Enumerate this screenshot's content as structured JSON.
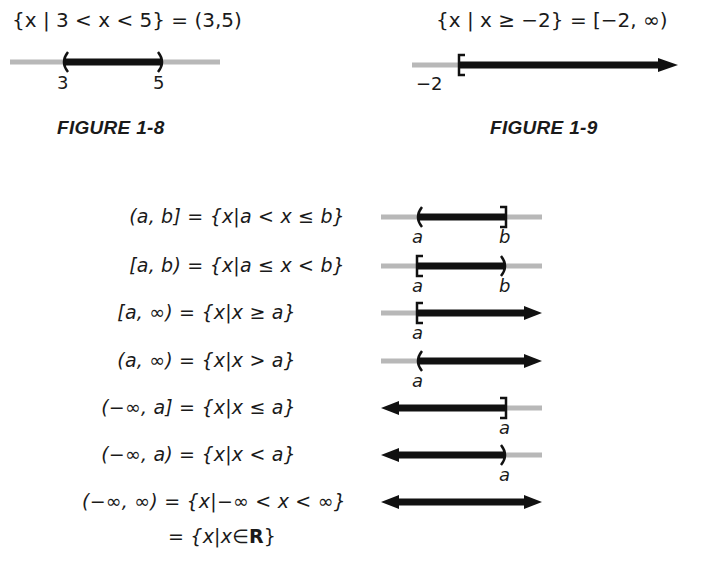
{
  "figure_1_8": {
    "equation": "{x | 3 < x < 5} = (3,5)",
    "tick_labels": [
      "3",
      "5"
    ],
    "caption": "FIGURE 1-8",
    "interval": {
      "left": 3,
      "right": 5,
      "left_bracket": "(",
      "right_bracket": ")"
    }
  },
  "figure_1_9": {
    "equation": "{x | x ≥ −2} = [−2, ∞)",
    "tick_labels": [
      "−2"
    ],
    "caption": "FIGURE 1-9",
    "interval": {
      "left": -2,
      "right": "∞",
      "left_bracket": "[",
      "right_bracket": "arrow"
    }
  },
  "table": {
    "rows": [
      {
        "notation": "(a, b]",
        "set": "{x|a < x ≤ b}",
        "labels": [
          "a",
          "b"
        ],
        "left": "(",
        "right": "]"
      },
      {
        "notation": "[a, b)",
        "set": "{x|a ≤ x < b}",
        "labels": [
          "a",
          "b"
        ],
        "left": "[",
        "right": ")"
      },
      {
        "notation": "[a, ∞)",
        "set": "{x|x ≥ a}",
        "labels": [
          "a"
        ],
        "left": "[",
        "right": "arrow"
      },
      {
        "notation": "(a, ∞)",
        "set": "{x|x > a}",
        "labels": [
          "a"
        ],
        "left": "(",
        "right": "arrow"
      },
      {
        "notation": "(−∞, a]",
        "set": "{x|x ≤ a}",
        "labels": [
          "a"
        ],
        "left": "arrow",
        "right": "]"
      },
      {
        "notation": "(−∞, a)",
        "set": "{x|x < a}",
        "labels": [
          "a"
        ],
        "left": "arrow",
        "right": ")"
      },
      {
        "notation": "(−∞, ∞)",
        "set": "{x|−∞ < x < ∞}",
        "labels": [],
        "left": "arrow",
        "right": "arrow"
      }
    ],
    "continuation": "= {x|x∈",
    "continuation_bold": "R",
    "continuation_end": "}"
  },
  "colors": {
    "axis_grey": "#b8b8b8",
    "interval_black": "#111111",
    "text": "#1a1a1a"
  }
}
